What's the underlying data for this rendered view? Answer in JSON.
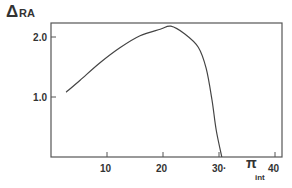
{
  "chart_data": {
    "type": "line",
    "title": "",
    "ylabel": "ΔRA",
    "ylabel_symbol": "Δ",
    "ylabel_text": "RA",
    "xlabel": "π int",
    "xlabel_main": "π",
    "xlabel_sub": "int",
    "xlim": [
      0,
      41
    ],
    "ylim": [
      0,
      2.25
    ],
    "xticks": [
      10,
      20,
      30,
      40
    ],
    "xtick_labels": [
      "10",
      "20",
      "30·",
      "40"
    ],
    "yticks": [
      1.0,
      2.0
    ],
    "ytick_labels": [
      "1.0",
      "2.0"
    ],
    "grid": false,
    "legend": null,
    "series": [
      {
        "name": "ΔRA",
        "x": [
          2.7,
          5.2,
          8.75,
          12.3,
          15.9,
          19.5,
          21.4,
          23.9,
          26.3,
          27.7,
          28.75,
          29.5,
          30.5
        ],
        "y": [
          1.08,
          1.28,
          1.57,
          1.82,
          2.02,
          2.13,
          2.18,
          2.05,
          1.83,
          1.48,
          0.95,
          0.45,
          0.0
        ]
      }
    ]
  },
  "colors": {
    "line": "#444444",
    "axis": "#555555",
    "text": "#333333",
    "background": "#ffffff"
  }
}
